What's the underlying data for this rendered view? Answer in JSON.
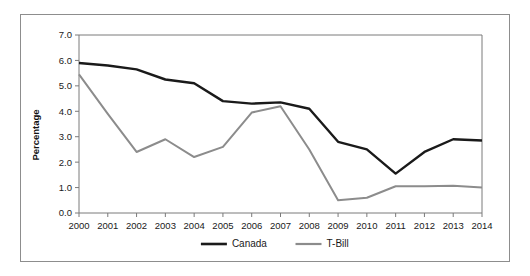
{
  "chart_data": {
    "type": "line",
    "title": "",
    "xlabel": "",
    "ylabel": "Percentage",
    "categories": [
      "2000",
      "2001",
      "2002",
      "2003",
      "2004",
      "2005",
      "2006",
      "2007",
      "2008",
      "2009",
      "2010",
      "2011",
      "2012",
      "2013",
      "2014"
    ],
    "x": [
      2000,
      2001,
      2002,
      2003,
      2004,
      2005,
      2006,
      2007,
      2008,
      2009,
      2010,
      2011,
      2012,
      2013,
      2014
    ],
    "ylim": [
      0.0,
      7.0
    ],
    "ytick_labels": [
      "0.0",
      "1.0",
      "2.0",
      "3.0",
      "4.0",
      "5.0",
      "6.0",
      "7.0"
    ],
    "ytick_values": [
      0.0,
      1.0,
      2.0,
      3.0,
      4.0,
      5.0,
      6.0,
      7.0
    ],
    "grid": false,
    "legend_position": "bottom",
    "series": [
      {
        "name": "Canada",
        "color": "#1a1a1a",
        "values": [
          5.9,
          5.8,
          5.65,
          5.25,
          5.1,
          4.4,
          4.3,
          4.35,
          4.1,
          2.8,
          2.5,
          1.55,
          2.4,
          2.9,
          2.85
        ]
      },
      {
        "name": "T-Bill",
        "color": "#8c8c8c",
        "values": [
          5.45,
          3.9,
          2.4,
          2.9,
          2.2,
          2.6,
          3.95,
          4.2,
          2.5,
          0.5,
          0.6,
          1.05,
          1.05,
          1.07,
          1.0
        ]
      }
    ]
  },
  "legend": {
    "items": [
      {
        "label": "Canada",
        "color": "#1a1a1a"
      },
      {
        "label": "T-Bill",
        "color": "#8c8c8c"
      }
    ]
  },
  "axes": {
    "y_title": "Percentage"
  }
}
